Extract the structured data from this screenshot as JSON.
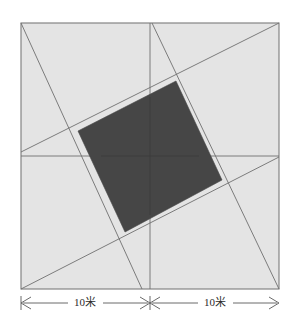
{
  "figure": {
    "colors": {
      "background": "#ffffff",
      "plot_fill": "#e4e4e4",
      "shaded_fill": "#464646",
      "outline": "#7a7a7a",
      "inner_line": "#6f6f6f",
      "dimension_line": "#5a5a5a",
      "label_text": "#2b2b2b"
    },
    "square": {
      "label": "square-plot",
      "x": 21,
      "y": 23,
      "width": 258,
      "height": 266,
      "side_length_total": "20米"
    },
    "center": {
      "x": 150,
      "y": 156
    },
    "midlines": {
      "horizontal": {
        "x1": 21,
        "y1": 156,
        "x2": 279,
        "y2": 156
      },
      "vertical": {
        "x1": 150,
        "y1": 23,
        "x2": 150,
        "y2": 289
      }
    },
    "pinwheel_lines": [
      {
        "name": "line-top-left-to-bottom-mid",
        "x1": 21,
        "y1": 23,
        "x2": 142,
        "y2": 289
      },
      {
        "name": "line-top-mid-to-right-mid",
        "x1": 152,
        "y1": 23,
        "x2": 279,
        "y2": 289
      },
      {
        "name": "line-left-mid-to-top-right",
        "x1": 21,
        "y1": 152,
        "x2": 279,
        "y2": 23
      },
      {
        "name": "line-bottom-left-to-right-mid",
        "x1": 21,
        "y1": 289,
        "x2": 279,
        "y2": 157
      }
    ],
    "shaded_quad": {
      "name": "shaded-inner-quadrilateral",
      "points": "176,81 222,180 125,232 78,131"
    },
    "dimensions": [
      {
        "name": "dimension-left",
        "label": "10米",
        "value": 10,
        "unit": "米",
        "x_start": 21,
        "x_end": 150,
        "y": 303,
        "label_x": 85
      },
      {
        "name": "dimension-right",
        "label": "10米",
        "value": 10,
        "unit": "米",
        "x_start": 150,
        "x_end": 279,
        "y": 303,
        "label_x": 215
      }
    ]
  }
}
